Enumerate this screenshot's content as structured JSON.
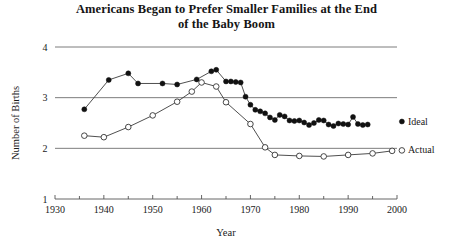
{
  "chart_data": {
    "type": "line",
    "title": "Americans Began to Prefer Smaller Families at the End of the Baby Boom",
    "title_line1": "Americans Began to Prefer Smaller Families at the End",
    "title_line2": "of the Baby Boom",
    "xlabel": "Year",
    "ylabel": "Number of Births",
    "xlim": [
      1930,
      2000
    ],
    "ylim": [
      1,
      4
    ],
    "xticks": [
      1930,
      1940,
      1950,
      1960,
      1970,
      1980,
      1990,
      2000
    ],
    "xtick_labels": [
      "1930",
      "1940",
      "1950",
      "1960",
      "1970",
      "1980",
      "1990",
      "2000"
    ],
    "xminor_ticks": [
      1935,
      1945,
      1955,
      1965,
      1975,
      1985,
      1995
    ],
    "yticks": [
      1,
      2,
      3,
      4
    ],
    "ytick_labels": [
      "1",
      "2",
      "3",
      "4"
    ],
    "grid": "horizontal",
    "legend_position": "right-inline",
    "series": [
      {
        "name": "Ideal",
        "marker": "filled-circle",
        "label_x": 2001,
        "label_y": 2.47,
        "points": [
          [
            1936,
            2.77
          ],
          [
            1941,
            3.35
          ],
          [
            1945,
            3.48
          ],
          [
            1947,
            3.28
          ],
          [
            1952,
            3.28
          ],
          [
            1955,
            3.26
          ],
          [
            1959,
            3.36
          ],
          [
            1962,
            3.52
          ],
          [
            1963,
            3.55
          ],
          [
            1965,
            3.32
          ],
          [
            1966,
            3.32
          ],
          [
            1967,
            3.31
          ],
          [
            1968,
            3.3
          ],
          [
            1969,
            3.02
          ],
          [
            1970,
            2.86
          ],
          [
            1971,
            2.76
          ],
          [
            1972,
            2.73
          ],
          [
            1973,
            2.69
          ],
          [
            1974,
            2.61
          ],
          [
            1975,
            2.56
          ],
          [
            1976,
            2.66
          ],
          [
            1977,
            2.63
          ],
          [
            1978,
            2.55
          ],
          [
            1979,
            2.54
          ],
          [
            1980,
            2.55
          ],
          [
            1981,
            2.51
          ],
          [
            1982,
            2.46
          ],
          [
            1983,
            2.5
          ],
          [
            1984,
            2.56
          ],
          [
            1985,
            2.55
          ],
          [
            1986,
            2.47
          ],
          [
            1987,
            2.44
          ],
          [
            1988,
            2.49
          ],
          [
            1989,
            2.48
          ],
          [
            1990,
            2.47
          ],
          [
            1991,
            2.62
          ],
          [
            1992,
            2.48
          ],
          [
            1993,
            2.46
          ],
          [
            1994,
            2.47
          ]
        ]
      },
      {
        "name": "Actual",
        "marker": "open-circle",
        "label_x": 2001,
        "label_y": 1.9,
        "points": [
          [
            1936,
            2.25
          ],
          [
            1940,
            2.22
          ],
          [
            1945,
            2.42
          ],
          [
            1950,
            2.65
          ],
          [
            1955,
            2.92
          ],
          [
            1958,
            3.12
          ],
          [
            1960,
            3.3
          ],
          [
            1963,
            3.22
          ],
          [
            1965,
            2.91
          ],
          [
            1970,
            2.48
          ],
          [
            1973,
            2.02
          ],
          [
            1975,
            1.87
          ],
          [
            1980,
            1.85
          ],
          [
            1985,
            1.84
          ],
          [
            1990,
            1.87
          ],
          [
            1995,
            1.9
          ],
          [
            1999,
            1.95
          ]
        ]
      }
    ]
  },
  "geometry": {
    "plot_left": 55,
    "plot_right": 397,
    "plot_top": 47,
    "plot_bottom": 199
  }
}
